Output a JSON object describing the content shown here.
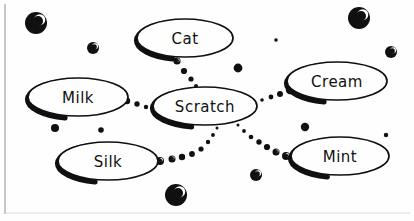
{
  "diagram": {
    "type": "concept-map",
    "style": "hand-drawn-sketch",
    "background_color": "#fefefe",
    "ink_color": "#101010",
    "border": {
      "left_rule_color": "#b9b9bd",
      "bottom_rule_color": "#d8d8dc"
    },
    "center_node": {
      "id": "scratch",
      "label": "Scratch",
      "cx": 205,
      "cy": 106,
      "rx": 52,
      "ry": 19,
      "font_size": 15
    },
    "nodes": [
      {
        "id": "cat",
        "label": "Cat",
        "cx": 185,
        "cy": 38,
        "rx": 48,
        "ry": 19,
        "font_size": 15
      },
      {
        "id": "milk",
        "label": "Milk",
        "cx": 78,
        "cy": 97,
        "rx": 50,
        "ry": 19,
        "font_size": 15
      },
      {
        "id": "cream",
        "label": "Cream",
        "cx": 337,
        "cy": 81,
        "rx": 50,
        "ry": 19,
        "font_size": 15
      },
      {
        "id": "silk",
        "label": "Silk",
        "cx": 108,
        "cy": 161,
        "rx": 50,
        "ry": 19,
        "font_size": 15
      },
      {
        "id": "mint",
        "label": "Mint",
        "cx": 340,
        "cy": 156,
        "rx": 49,
        "ry": 19,
        "font_size": 15
      }
    ],
    "edges": [
      {
        "id": "edge-cat-scratch",
        "from": "cat",
        "to": "scratch",
        "style": "dotted-tapered",
        "dots": [
          {
            "cx": 177,
            "cy": 61,
            "r": 3.6
          },
          {
            "cx": 184,
            "cy": 71,
            "r": 3.1
          },
          {
            "cx": 191,
            "cy": 79,
            "r": 2.6
          },
          {
            "cx": 196,
            "cy": 86,
            "r": 2.0
          },
          {
            "cx": 201,
            "cy": 92,
            "r": 1.5
          }
        ]
      },
      {
        "id": "edge-milk-scratch",
        "from": "milk",
        "to": "scratch",
        "style": "dotted-tapered",
        "dots": [
          {
            "cx": 127,
            "cy": 101,
            "r": 3.2
          },
          {
            "cx": 137,
            "cy": 104,
            "r": 2.7
          },
          {
            "cx": 146,
            "cy": 107,
            "r": 2.2
          },
          {
            "cx": 153,
            "cy": 109,
            "r": 1.7
          }
        ]
      },
      {
        "id": "edge-scratch-cream",
        "from": "scratch",
        "to": "cream",
        "style": "dotted-tapered",
        "dots": [
          {
            "cx": 262,
            "cy": 100,
            "r": 1.8
          },
          {
            "cx": 271,
            "cy": 97,
            "r": 2.4
          },
          {
            "cx": 280,
            "cy": 94,
            "r": 3.0
          },
          {
            "cx": 290,
            "cy": 90,
            "r": 4.2
          }
        ]
      },
      {
        "id": "edge-silk-scratch",
        "from": "silk",
        "to": "scratch",
        "style": "dotted-tapered",
        "dots": [
          {
            "cx": 160,
            "cy": 161,
            "r": 4.0
          },
          {
            "cx": 172,
            "cy": 159,
            "r": 3.5
          },
          {
            "cx": 182,
            "cy": 157,
            "r": 3.2
          },
          {
            "cx": 192,
            "cy": 154,
            "r": 2.9
          },
          {
            "cx": 201,
            "cy": 149,
            "r": 2.6
          },
          {
            "cx": 208,
            "cy": 142,
            "r": 2.2
          },
          {
            "cx": 213,
            "cy": 135,
            "r": 1.9
          },
          {
            "cx": 217,
            "cy": 128,
            "r": 1.5
          }
        ]
      },
      {
        "id": "edge-scratch-mint",
        "from": "scratch",
        "to": "mint",
        "style": "dotted-tapered",
        "dots": [
          {
            "cx": 238,
            "cy": 125,
            "r": 1.5
          },
          {
            "cx": 244,
            "cy": 131,
            "r": 1.9
          },
          {
            "cx": 251,
            "cy": 137,
            "r": 2.3
          },
          {
            "cx": 259,
            "cy": 142,
            "r": 2.7
          },
          {
            "cx": 267,
            "cy": 147,
            "r": 3.1
          },
          {
            "cx": 276,
            "cy": 152,
            "r": 3.5
          },
          {
            "cx": 286,
            "cy": 156,
            "r": 4.0
          }
        ]
      }
    ],
    "decorative_dots": [
      {
        "id": "dot-top-left-large",
        "cx": 36,
        "cy": 23,
        "r": 11,
        "highlight": true
      },
      {
        "id": "dot-top-right-large",
        "cx": 359,
        "cy": 18,
        "r": 11,
        "highlight": true
      },
      {
        "id": "dot-upper-left-mid",
        "cx": 93,
        "cy": 48,
        "r": 6,
        "highlight": true
      },
      {
        "id": "dot-far-right-upper",
        "cx": 391,
        "cy": 52,
        "r": 6,
        "highlight": true
      },
      {
        "id": "dot-center-top-tiny",
        "cx": 276,
        "cy": 40,
        "r": 1.8,
        "highlight": false
      },
      {
        "id": "dot-center-upper",
        "cx": 238,
        "cy": 68,
        "r": 4.4,
        "highlight": false
      },
      {
        "id": "dot-left-lower",
        "cx": 55,
        "cy": 128,
        "r": 4.0,
        "highlight": false
      },
      {
        "id": "dot-left-lower-small",
        "cx": 101,
        "cy": 130,
        "r": 2.8,
        "highlight": false
      },
      {
        "id": "dot-right-lower",
        "cx": 305,
        "cy": 127,
        "r": 4.2,
        "highlight": false
      },
      {
        "id": "dot-far-right-lower",
        "cx": 386,
        "cy": 135,
        "r": 2.2,
        "highlight": false
      },
      {
        "id": "dot-bottom-center-large",
        "cx": 176,
        "cy": 195,
        "r": 11,
        "highlight": true
      },
      {
        "id": "dot-bottom-mid",
        "cx": 256,
        "cy": 175,
        "r": 6,
        "highlight": true
      }
    ]
  }
}
